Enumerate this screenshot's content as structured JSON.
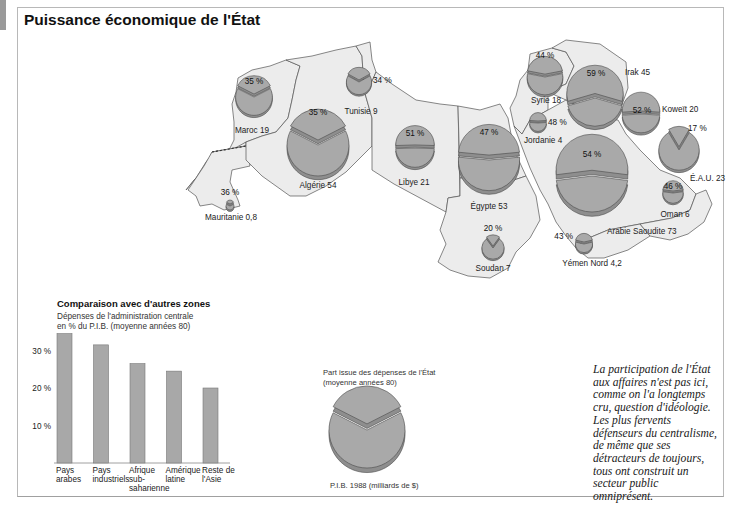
{
  "title": "Puissance économique de l'État",
  "map": {
    "countries": [
      {
        "name": "Maroc",
        "gdp": 19,
        "pct": 35,
        "label": "Maroc 19",
        "pct_label": "35 %"
      },
      {
        "name": "Algérie",
        "gdp": 54,
        "pct": 35,
        "label": "Algérie 54",
        "pct_label": "35 %"
      },
      {
        "name": "Tunisie",
        "gdp": 9,
        "pct": 34,
        "label": "Tunisie 9",
        "pct_label": "34 %"
      },
      {
        "name": "Mauritanie",
        "gdp": 0.8,
        "pct": 36,
        "label": "Mauritanie 0,8",
        "pct_label": "36 %"
      },
      {
        "name": "Libye",
        "gdp": 21,
        "pct": 51,
        "label": "Libye 21",
        "pct_label": "51 %"
      },
      {
        "name": "Égypte",
        "gdp": 53,
        "pct": 47,
        "label": "Égypte 53",
        "pct_label": "47 %"
      },
      {
        "name": "Soudan",
        "gdp": 7,
        "pct": 20,
        "label": "Soudan 7",
        "pct_label": "20 %"
      },
      {
        "name": "Syrie",
        "gdp": 18,
        "pct": 44,
        "label": "Syrie 18",
        "pct_label": "44 %"
      },
      {
        "name": "Jordanie",
        "gdp": 4,
        "pct": 48,
        "label": "Jordanie 4",
        "pct_label": "48 %"
      },
      {
        "name": "Irak",
        "gdp": 45,
        "pct": 59,
        "label": "Irak 45",
        "pct_label": "59 %"
      },
      {
        "name": "Koweït",
        "gdp": 20,
        "pct": 52,
        "label": "Koweït 20",
        "pct_label": "52 %"
      },
      {
        "name": "É.A.U.",
        "gdp": 23,
        "pct": 17,
        "label": "É.A.U. 23",
        "pct_label": "17 %"
      },
      {
        "name": "Arabie Saoudite",
        "gdp": 73,
        "pct": 54,
        "label": "Arabie Saoudite 73",
        "pct_label": "54 %"
      },
      {
        "name": "Oman",
        "gdp": 6,
        "pct": 46,
        "label": "Oman 6",
        "pct_label": "46 %"
      },
      {
        "name": "Yémen Nord",
        "gdp": 4.2,
        "pct": 43,
        "label": "Yémen Nord 4,2",
        "pct_label": "43 %"
      }
    ]
  },
  "comparison": {
    "title": "Comparaison avec d'autres zones",
    "subtitle_line1": "Dépenses de l'administration centrale",
    "subtitle_line2": "en % du P.I.B. (moyenne années 80)"
  },
  "legend": {
    "top_line1": "Part issue des dépenses de l'État",
    "top_line2": "(moyenne années 80)",
    "bottom": "P.I.B. 1988 (milliards de $)"
  },
  "quote": {
    "lines": [
      "La participation de l'État",
      "aux affaires n'est pas ici,",
      "comme on l'a longtemps",
      "cru, question d'idéologie.",
      "Les plus fervents",
      "défenseurs du centralisme,",
      "de même que ses",
      "détracteurs de toujours,",
      "tous ont construit un",
      "secteur public",
      "omniprésent."
    ]
  },
  "colors": {
    "pie_fill": "#a9a9a9",
    "pie_side": "#8e8e8e",
    "pie_stroke": "#4a4a4a",
    "land": "#ececec",
    "border": "#555555",
    "bar_fill": "#a8a8a8"
  },
  "chart_data": [
    {
      "type": "bar",
      "title": "Comparaison avec d'autres zones",
      "subtitle": "Dépenses de l'administration centrale en % du P.I.B. (moyenne années 80)",
      "categories": [
        "Pays arabes",
        "Pays industriels",
        "Afrique sub-saharienne",
        "Amérique latine",
        "Reste de l'Asie"
      ],
      "category_lines": [
        [
          "Pays",
          "arabes"
        ],
        [
          "Pays",
          "industriels"
        ],
        [
          "Afrique",
          "sub-",
          "saharienne"
        ],
        [
          "Amérique",
          "latine"
        ],
        [
          "Reste de",
          "l'Asie"
        ]
      ],
      "values": [
        34.5,
        31.5,
        26.5,
        24.5,
        20
      ],
      "yticks": [
        10,
        20,
        30
      ],
      "ytick_labels": [
        "10 %",
        "20 %",
        "30 %"
      ],
      "ylim": [
        0,
        35
      ],
      "xlabel": "",
      "ylabel": "",
      "grid": false
    },
    {
      "type": "pie",
      "title": "Part de l'État dans le P.I.B. par pays",
      "size_variable": "P.I.B. 1988 (milliards de $)",
      "slice_variable": "Part issue des dépenses de l'État (moyenne années 80)",
      "series": [
        {
          "name": "Maroc",
          "gdp": 19,
          "state_share_pct": 35
        },
        {
          "name": "Algérie",
          "gdp": 54,
          "state_share_pct": 35
        },
        {
          "name": "Tunisie",
          "gdp": 9,
          "state_share_pct": 34
        },
        {
          "name": "Mauritanie",
          "gdp": 0.8,
          "state_share_pct": 36
        },
        {
          "name": "Libye",
          "gdp": 21,
          "state_share_pct": 51
        },
        {
          "name": "Égypte",
          "gdp": 53,
          "state_share_pct": 47
        },
        {
          "name": "Soudan",
          "gdp": 7,
          "state_share_pct": 20
        },
        {
          "name": "Syrie",
          "gdp": 18,
          "state_share_pct": 44
        },
        {
          "name": "Jordanie",
          "gdp": 4,
          "state_share_pct": 48
        },
        {
          "name": "Irak",
          "gdp": 45,
          "state_share_pct": 59
        },
        {
          "name": "Koweït",
          "gdp": 20,
          "state_share_pct": 52
        },
        {
          "name": "É.A.U.",
          "gdp": 23,
          "state_share_pct": 17
        },
        {
          "name": "Arabie Saoudite",
          "gdp": 73,
          "state_share_pct": 54
        },
        {
          "name": "Oman",
          "gdp": 6,
          "state_share_pct": 46
        },
        {
          "name": "Yémen Nord",
          "gdp": 4.2,
          "state_share_pct": 43
        }
      ]
    }
  ]
}
